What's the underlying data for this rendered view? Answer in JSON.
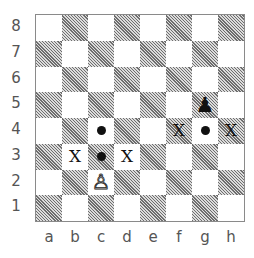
{
  "diagram": {
    "ranks": [
      "8",
      "7",
      "6",
      "5",
      "4",
      "3",
      "2",
      "1"
    ],
    "files": [
      "a",
      "b",
      "c",
      "d",
      "e",
      "f",
      "g",
      "h"
    ],
    "pieces": [
      {
        "square": "c2",
        "type": "pawn",
        "color": "white",
        "glyph": "♙"
      },
      {
        "square": "g5",
        "type": "pawn",
        "color": "black",
        "glyph": "♟"
      }
    ],
    "dots": [
      "c4",
      "c3",
      "g4"
    ],
    "x_marks": [
      {
        "square": "b3",
        "label": "X"
      },
      {
        "square": "d3",
        "label": "X"
      },
      {
        "square": "f4",
        "label": "X"
      },
      {
        "square": "h4",
        "label": "X"
      }
    ],
    "colors": {
      "light_square": "#ffffff",
      "dark_square_hatch": "#6e6e6e",
      "marker": "#111111",
      "label": "#555555",
      "border": "#8a8a8a"
    }
  }
}
